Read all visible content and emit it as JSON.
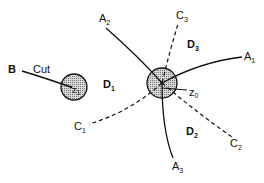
{
  "diagram": {
    "type": "complex-plane contour / domain diagram",
    "colors": {
      "ink": "#111111",
      "fill": "#bbbbbb",
      "background": "#ffffff"
    },
    "points": [
      {
        "id": "z1",
        "label": "z",
        "sub": "1",
        "desc": "endpoint of cut inside small shaded disk"
      },
      {
        "id": "z0",
        "label": "z",
        "sub": "0",
        "desc": "center of shaded disk where curves meet"
      }
    ],
    "cut": {
      "start_label": "B",
      "text": "Cut"
    },
    "solid_curves": [
      {
        "id": "A1",
        "label": "A",
        "sub": "1"
      },
      {
        "id": "A2",
        "label": "A",
        "sub": "2"
      },
      {
        "id": "A3",
        "label": "A",
        "sub": "3"
      }
    ],
    "dashed_curves": [
      {
        "id": "C1",
        "label": "C",
        "sub": "1"
      },
      {
        "id": "C2",
        "label": "C",
        "sub": "2"
      },
      {
        "id": "C3",
        "label": "C",
        "sub": "3"
      }
    ],
    "regions": [
      {
        "id": "D1",
        "label": "D",
        "sub": "1"
      },
      {
        "id": "D2",
        "label": "D",
        "sub": "2"
      },
      {
        "id": "D3",
        "label": "D",
        "sub": "3"
      }
    ]
  }
}
